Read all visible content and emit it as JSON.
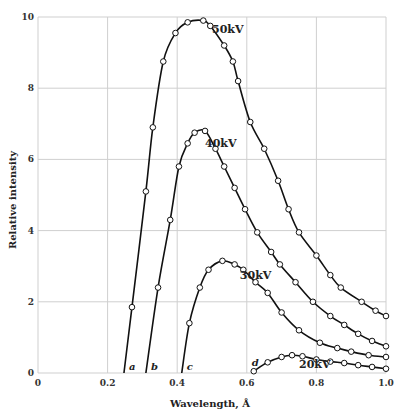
{
  "chart_data": {
    "type": "line",
    "title": "",
    "xlabel": "Wavelength, Å",
    "ylabel": "Relative intensity",
    "xlim": [
      0,
      1.0
    ],
    "ylim": [
      0,
      10
    ],
    "grid": true,
    "x_ticks": [
      "0",
      "0.2",
      "0.4",
      "0.6",
      "0.8",
      "1.0"
    ],
    "y_ticks": [
      "0",
      "2",
      "4",
      "6",
      "8",
      "10"
    ],
    "series": [
      {
        "name": "50kV",
        "cutoff_label": "a",
        "cutoff": 0.247,
        "points": [
          [
            0.247,
            0
          ],
          [
            0.27,
            1.85
          ],
          [
            0.31,
            5.1
          ],
          [
            0.33,
            6.9
          ],
          [
            0.36,
            8.75
          ],
          [
            0.395,
            9.55
          ],
          [
            0.43,
            9.85
          ],
          [
            0.475,
            9.9
          ],
          [
            0.495,
            9.75
          ],
          [
            0.535,
            9.2
          ],
          [
            0.56,
            8.75
          ],
          [
            0.575,
            8.2
          ],
          [
            0.61,
            7.05
          ],
          [
            0.65,
            6.3
          ],
          [
            0.69,
            5.4
          ],
          [
            0.72,
            4.6
          ],
          [
            0.75,
            3.95
          ],
          [
            0.8,
            3.3
          ],
          [
            0.84,
            2.75
          ],
          [
            0.87,
            2.4
          ],
          [
            0.93,
            2.0
          ],
          [
            0.97,
            1.75
          ],
          [
            1.0,
            1.6
          ]
        ],
        "label_pos": [
          0.5,
          9.55
        ]
      },
      {
        "name": "40kV",
        "cutoff_label": "b",
        "cutoff": 0.31,
        "points": [
          [
            0.31,
            0
          ],
          [
            0.345,
            2.4
          ],
          [
            0.38,
            4.3
          ],
          [
            0.405,
            5.8
          ],
          [
            0.43,
            6.45
          ],
          [
            0.45,
            6.75
          ],
          [
            0.48,
            6.8
          ],
          [
            0.51,
            6.3
          ],
          [
            0.535,
            5.8
          ],
          [
            0.565,
            5.2
          ],
          [
            0.595,
            4.6
          ],
          [
            0.63,
            3.95
          ],
          [
            0.67,
            3.4
          ],
          [
            0.695,
            3.05
          ],
          [
            0.74,
            2.55
          ],
          [
            0.79,
            2.0
          ],
          [
            0.84,
            1.6
          ],
          [
            0.88,
            1.35
          ],
          [
            0.92,
            1.1
          ],
          [
            0.96,
            0.9
          ],
          [
            1.0,
            0.75
          ]
        ],
        "label_pos": [
          0.48,
          6.35
        ]
      },
      {
        "name": "30kV",
        "cutoff_label": "c",
        "cutoff": 0.413,
        "points": [
          [
            0.413,
            0
          ],
          [
            0.435,
            1.4
          ],
          [
            0.465,
            2.4
          ],
          [
            0.49,
            2.9
          ],
          [
            0.53,
            3.15
          ],
          [
            0.565,
            3.05
          ],
          [
            0.59,
            2.9
          ],
          [
            0.625,
            2.55
          ],
          [
            0.66,
            2.25
          ],
          [
            0.7,
            1.7
          ],
          [
            0.75,
            1.2
          ],
          [
            0.81,
            0.85
          ],
          [
            0.86,
            0.7
          ],
          [
            0.9,
            0.6
          ],
          [
            0.95,
            0.5
          ],
          [
            1.0,
            0.45
          ]
        ],
        "label_pos": [
          0.58,
          2.65
        ]
      },
      {
        "name": "20kV",
        "cutoff_label": "d",
        "cutoff": 0.62,
        "points": [
          [
            0.62,
            0.05
          ],
          [
            0.66,
            0.3
          ],
          [
            0.7,
            0.45
          ],
          [
            0.73,
            0.5
          ],
          [
            0.76,
            0.47
          ],
          [
            0.8,
            0.38
          ],
          [
            0.84,
            0.32
          ],
          [
            0.88,
            0.28
          ],
          [
            0.92,
            0.22
          ],
          [
            0.96,
            0.17
          ],
          [
            1.0,
            0.12
          ]
        ],
        "label_pos": [
          0.75,
          0.15
        ]
      }
    ]
  }
}
